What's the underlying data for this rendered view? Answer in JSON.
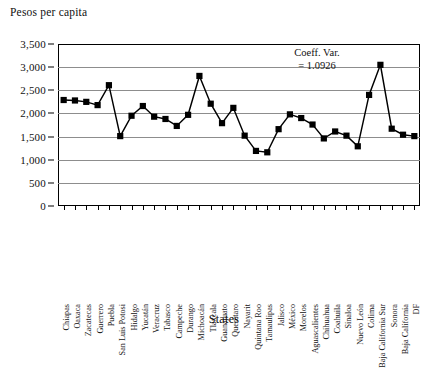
{
  "chart_data": {
    "type": "line",
    "title": "",
    "ylabel": "Pesos per capita",
    "xlabel": "States",
    "ylim": [
      0,
      3500
    ],
    "ytick_step": 500,
    "yticks": [
      "0",
      "500",
      "1,000",
      "1,500",
      "2,000",
      "2,500",
      "3,000",
      "3,500"
    ],
    "grid": true,
    "legend": "none",
    "marker": "square",
    "annotations": [
      {
        "line1": "Coeff. Var.",
        "line2": "= 1.0926"
      }
    ],
    "categories": [
      "Chiapas",
      "Oaxaca",
      "Zacatecas",
      "Guerrero",
      "Puebla",
      "San Luis Potosi",
      "Hidalgo",
      "Yucatán",
      "Veracruz",
      "Tabasco",
      "Campeche",
      "Durango",
      "Michoacán",
      "Tlaxcala",
      "Guanajuato",
      "Querétaro",
      "Nayarit",
      "Quintana Roo",
      "Tamaulipas",
      "Jalisco",
      "México",
      "Morelos",
      "Aguascalientes",
      "Chihuahua",
      "Coahuila",
      "Sinaloa",
      "Nuevo León",
      "Colima",
      "Baja California Sur",
      "Sonora",
      "Baja California",
      "DF"
    ],
    "values": [
      2290,
      2280,
      2250,
      2180,
      2610,
      1510,
      1950,
      2160,
      1930,
      1880,
      1730,
      1970,
      2810,
      2210,
      1790,
      2120,
      1520,
      1190,
      1160,
      1660,
      1980,
      1900,
      1760,
      1460,
      1610,
      1520,
      1290,
      2400,
      3050,
      1670,
      1540,
      1510
    ]
  }
}
